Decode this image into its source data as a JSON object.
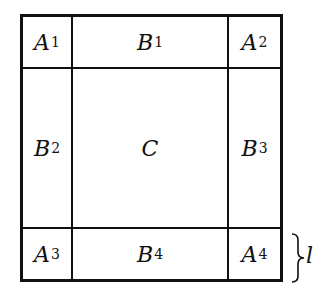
{
  "diagram": {
    "type": "partitioned-square",
    "colors": {
      "stroke": "#111111",
      "background": "#ffffff"
    },
    "cells": {
      "A1": {
        "main": "A",
        "sub": "1"
      },
      "B1": {
        "main": "B",
        "sub": "1"
      },
      "A2": {
        "main": "A",
        "sub": "2"
      },
      "B2": {
        "main": "B",
        "sub": "2"
      },
      "C": {
        "main": "C",
        "sub": ""
      },
      "B3": {
        "main": "B",
        "sub": "3"
      },
      "A3": {
        "main": "A",
        "sub": "3"
      },
      "B4": {
        "main": "B",
        "sub": "4"
      },
      "A4": {
        "main": "A",
        "sub": "4"
      }
    },
    "brace_label": "l"
  }
}
